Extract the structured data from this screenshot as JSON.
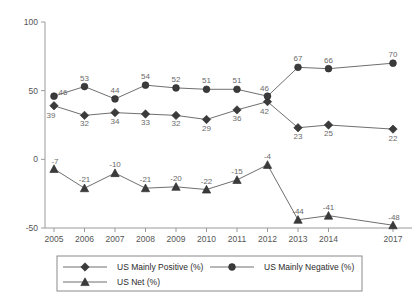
{
  "chart_data": {
    "type": "line",
    "title": "",
    "subtitle": "",
    "xlabel": "",
    "ylabel": "",
    "ylim": [
      -50,
      100
    ],
    "yticks": [
      100,
      50,
      0,
      -50
    ],
    "ytick_labels": [
      "100",
      "50",
      "0",
      "-50"
    ],
    "grid": false,
    "legend_position": "bottom",
    "categories": [
      "2005",
      "2006",
      "2007",
      "2008",
      "2009",
      "2010",
      "2011",
      "2012",
      "2013",
      "2014",
      "2017"
    ],
    "series": [
      {
        "name": "US Mainly Positive (%)",
        "marker": "diamond",
        "values": [
          39,
          32,
          34,
          33,
          32,
          29,
          36,
          42,
          23,
          25,
          22
        ],
        "labels": [
          "39",
          "32",
          "34",
          "33",
          "32",
          "29",
          "36",
          "42",
          "23",
          "25",
          "22"
        ]
      },
      {
        "name": "US Mainly Negative (%)",
        "marker": "circle",
        "values": [
          46,
          53,
          44,
          54,
          52,
          51,
          51,
          46,
          67,
          66,
          70
        ],
        "labels": [
          "46",
          "53",
          "44",
          "54",
          "52",
          "51",
          "51",
          "46",
          "67",
          "66",
          "70"
        ]
      },
      {
        "name": "US Net (%)",
        "marker": "triangle",
        "values": [
          -7,
          -21,
          -10,
          -21,
          -20,
          -22,
          -15,
          -4,
          -44,
          -41,
          -48
        ],
        "labels": [
          "-7",
          "-21",
          "-10",
          "-21",
          "-20",
          "-22",
          "-15",
          "-4",
          "-44",
          "-41",
          "-48"
        ]
      }
    ],
    "colors": {
      "line": "#6f6f6f",
      "marker": "#3b3b3b",
      "axis": "#9a9a9a",
      "label": "#6a6a6a",
      "legend_text": "#2b2b2b",
      "background": "#ffffff"
    }
  },
  "legend": {
    "items": [
      {
        "label": "US Mainly Positive (%)",
        "marker": "diamond"
      },
      {
        "label": "US Mainly Negative (%)",
        "marker": "circle"
      },
      {
        "label": "US Net (%)",
        "marker": "triangle"
      }
    ]
  }
}
